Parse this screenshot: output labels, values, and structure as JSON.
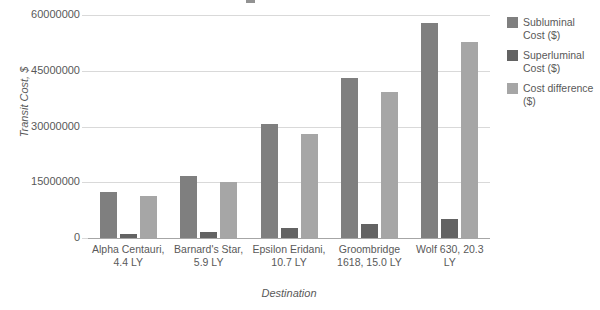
{
  "chart_data": {
    "type": "bar",
    "title": "",
    "xlabel": "Destination",
    "ylabel": "Transit Cost, $",
    "categories": [
      "Alpha Centauri, 4.4 LY",
      "Barnard's Star, 5.9 LY",
      "Epsilon Eridani, 10.7 LY",
      "Groombridge 1618, 15.0 LY",
      "Wolf 630, 20.3 LY"
    ],
    "series": [
      {
        "name": "Subluminal Cost ($)",
        "color": "#7f7f7f",
        "values": [
          12300000,
          16600000,
          30700000,
          43000000,
          57800000
        ]
      },
      {
        "name": "Superluminal Cost ($)",
        "color": "#636363",
        "values": [
          1100000,
          1600000,
          2600000,
          3800000,
          5000000
        ]
      },
      {
        "name": "Cost difference ($)",
        "color": "#a6a6a6",
        "values": [
          11200000,
          15000000,
          28000000,
          39200000,
          52800000
        ]
      }
    ],
    "ylim": [
      0,
      60000000
    ],
    "y_ticks": [
      0,
      15000000,
      30000000,
      45000000,
      60000000
    ],
    "y_tick_labels": [
      "0",
      "15000000",
      "30000000",
      "45000000",
      "60000000"
    ],
    "grid": true,
    "legend_position": "right"
  },
  "legend": {
    "items": [
      {
        "label": "Subluminal Cost ($)",
        "color": "#7f7f7f"
      },
      {
        "label": "Superluminal Cost ($)",
        "color": "#636363"
      },
      {
        "label": "Cost difference ($)",
        "color": "#a6a6a6"
      }
    ]
  },
  "axes": {
    "y_title": "Transit Cost, $",
    "x_title": "Destination"
  }
}
